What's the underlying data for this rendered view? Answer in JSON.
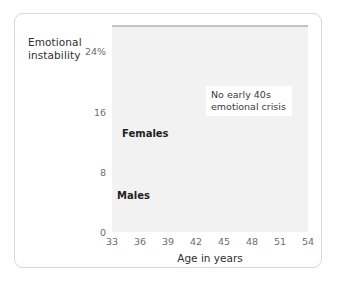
{
  "chart_data": {
    "type": "line",
    "title": "",
    "ylabel_line1": "Emotional",
    "ylabel_line2": "instability",
    "xlabel": "Age in years",
    "xlim": [
      33,
      54
    ],
    "ylim": [
      0,
      27.5
    ],
    "ytick_labels": [
      "24%",
      "16",
      "8",
      "0"
    ],
    "ytick_values": [
      24,
      16,
      8,
      0
    ],
    "xtick_labels": [
      "33",
      "36",
      "39",
      "42",
      "45",
      "48",
      "51",
      "54"
    ],
    "xtick_values": [
      33,
      36,
      39,
      42,
      45,
      48,
      51,
      54
    ],
    "grid": true,
    "legend": "inline-labels",
    "x": [
      33,
      34,
      35,
      36,
      37,
      38,
      39,
      40,
      41,
      42,
      43,
      44,
      45,
      46,
      47,
      48,
      49,
      50,
      51,
      52,
      53,
      54
    ],
    "series": [
      {
        "name": "Females",
        "color": "#9a9a9a",
        "values": [
          12.9,
          13.8,
          13.2,
          12.6,
          13.1,
          12.9,
          13.3,
          13.4,
          13.3,
          13.0,
          13.4,
          13.3,
          13.5,
          13.4,
          13.2,
          13.8,
          13.3,
          13.9,
          14.0,
          13.6,
          14.2,
          14.5
        ]
      },
      {
        "name": "Males",
        "color": "#c6c6c6",
        "values": [
          10.1,
          10.4,
          9.6,
          8.2,
          9.9,
          10.1,
          10.5,
          10.3,
          9.6,
          9.7,
          10.0,
          8.1,
          10.2,
          10.2,
          10.4,
          10.0,
          9.3,
          9.9,
          10.6,
          11.8,
          10.3,
          9.7
        ]
      }
    ],
    "annotations": [
      {
        "name": "no-crisis-note",
        "line1": "No early 40s",
        "line2": "emotional crisis"
      }
    ]
  },
  "labels": {
    "females": "Females",
    "males": "Males"
  }
}
